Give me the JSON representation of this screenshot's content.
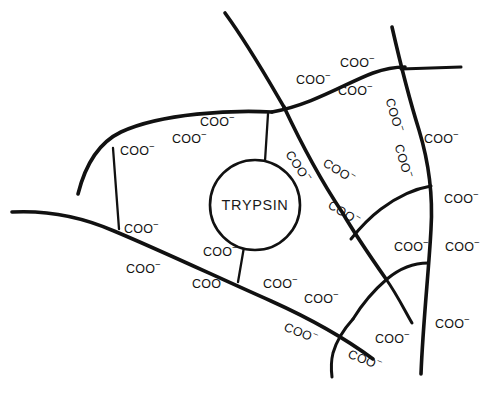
{
  "figure": {
    "name": "trypsin-carboxylate-network",
    "background_color": "#ffffff",
    "stroke_color": "#111111",
    "width": 503,
    "height": 403
  },
  "enzyme": {
    "label": "TRYPSIN",
    "shape": "circle",
    "center_x": 255,
    "center_y": 205,
    "radius": 45
  },
  "charge_group": {
    "text": "COO",
    "charge": "−",
    "full": "COO−"
  },
  "labels": [
    {
      "id": "coo-01",
      "text": "COO",
      "charge": "−",
      "x": 120,
      "y": 142,
      "rotation": 0
    },
    {
      "id": "coo-02",
      "text": "COO",
      "charge": "−",
      "x": 172,
      "y": 130,
      "rotation": 0
    },
    {
      "id": "coo-03",
      "text": "COO",
      "charge": "−",
      "x": 200,
      "y": 113,
      "rotation": 0
    },
    {
      "id": "coo-04",
      "text": "COO",
      "charge": "−",
      "x": 296,
      "y": 71,
      "rotation": 0
    },
    {
      "id": "coo-05",
      "text": "COO",
      "charge": "−",
      "x": 340,
      "y": 54,
      "rotation": 0
    },
    {
      "id": "coo-06",
      "text": "COO",
      "charge": "−",
      "x": 338,
      "y": 82,
      "rotation": 0
    },
    {
      "id": "coo-07",
      "text": "COO",
      "charge": "−",
      "x": 398,
      "y": 96,
      "rotation": 73
    },
    {
      "id": "coo-08",
      "text": "COO",
      "charge": "−",
      "x": 424,
      "y": 130,
      "rotation": 0
    },
    {
      "id": "coo-09",
      "text": "COO",
      "charge": "−",
      "x": 407,
      "y": 142,
      "rotation": 73
    },
    {
      "id": "coo-10",
      "text": "COO",
      "charge": "−",
      "x": 444,
      "y": 190,
      "rotation": 0
    },
    {
      "id": "coo-11",
      "text": "COO",
      "charge": "−",
      "x": 445,
      "y": 238,
      "rotation": 0
    },
    {
      "id": "coo-12",
      "text": "COO",
      "charge": "−",
      "x": 435,
      "y": 315,
      "rotation": 0
    },
    {
      "id": "coo-13",
      "text": "COO",
      "charge": "−",
      "x": 394,
      "y": 238,
      "rotation": 0
    },
    {
      "id": "coo-14",
      "text": "COO",
      "charge": "−",
      "x": 296,
      "y": 147,
      "rotation": 56
    },
    {
      "id": "coo-15",
      "text": "COO",
      "charge": "−",
      "x": 329,
      "y": 154,
      "rotation": 32
    },
    {
      "id": "coo-16",
      "text": "COO",
      "charge": "−",
      "x": 334,
      "y": 196,
      "rotation": 32
    },
    {
      "id": "coo-17",
      "text": "COO",
      "charge": "−",
      "x": 124,
      "y": 220,
      "rotation": 0
    },
    {
      "id": "coo-18",
      "text": "COO",
      "charge": "−",
      "x": 126,
      "y": 260,
      "rotation": 0
    },
    {
      "id": "coo-19",
      "text": "COO",
      "charge": "−",
      "x": 203,
      "y": 243,
      "rotation": 0
    },
    {
      "id": "coo-20",
      "text": "COO",
      "charge": "−",
      "x": 192,
      "y": 275,
      "rotation": 0
    },
    {
      "id": "coo-21",
      "text": "COO",
      "charge": "−",
      "x": 263,
      "y": 275,
      "rotation": 0
    },
    {
      "id": "coo-22",
      "text": "COO",
      "charge": "−",
      "x": 304,
      "y": 290,
      "rotation": 0
    },
    {
      "id": "coo-23",
      "text": "COO",
      "charge": "−",
      "x": 288,
      "y": 318,
      "rotation": 22
    },
    {
      "id": "coo-24",
      "text": "COO",
      "charge": "−",
      "x": 352,
      "y": 345,
      "rotation": 22
    },
    {
      "id": "coo-25",
      "text": "COO",
      "charge": "−",
      "x": 375,
      "y": 330,
      "rotation": 0
    }
  ],
  "curves": {
    "top_branch": "M 225 12 C 250 45, 268 78, 285 108",
    "upper_left_arc": "M 76 192 C 86 160, 100 140, 120 131 C 160 114, 230 110, 272 112",
    "upper_ridge_right": "M 272 112 C 310 104, 345 82, 372 72 C 386 67, 396 66, 404 66",
    "cross_horizontal": "M 400 70 L 460 68",
    "cross_vertical": "M 393 28 C 400 60, 408 96, 418 128 C 428 162, 432 196, 430 228 C 428 268, 422 320, 420 372",
    "left_vertical": "M 113 147 L 118 228",
    "lower_left_line": "M 12 212 C 50 210, 80 216, 113 230 C 160 250, 220 278, 270 300 C 310 318, 345 338, 372 358",
    "circle_top_stem": "M 268 113 L 265 162",
    "circle_bottom_stem": "M 243 248 L 237 281",
    "main_diagonal": "M 285 108 C 300 140, 320 178, 342 212 C 356 235, 372 258, 385 278",
    "right_branch_upper": "M 430 185 C 412 188, 396 196, 380 208 C 368 217, 358 228, 350 238",
    "right_branch_lower": "M 427 262 C 412 262, 398 268, 386 278 C 372 290, 360 305, 352 318",
    "bottom_hook": "M 352 318 C 343 328, 336 338, 332 352 C 330 360, 330 368, 331 376",
    "right_tail": "M 385 278 C 395 292, 404 308, 412 322"
  }
}
